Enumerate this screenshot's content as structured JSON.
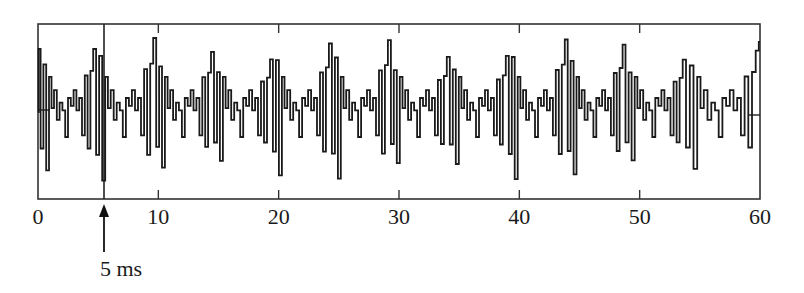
{
  "chart_data": {
    "type": "line",
    "title": "",
    "xlabel": "",
    "ylabel": "",
    "x_unit": "ms",
    "xlim": [
      0,
      60
    ],
    "ylim": [
      -1,
      1
    ],
    "grid": false,
    "x_ticks": [
      0,
      10,
      20,
      30,
      40,
      50,
      60
    ],
    "x_tick_labels": [
      "0",
      "10",
      "20",
      "30",
      "40",
      "50",
      "60"
    ],
    "series": [
      {
        "name": "waveform",
        "description": "Quasi-periodic speech-like waveform with fundamental period of about 5 ms (~200 Hz); each period has a large positive/negative spike pair followed by smaller ripples",
        "period_ms": 4.95,
        "major_peak_times_ms": [
          0.1,
          4.7,
          9.7,
          14.5,
          19.4,
          24.3,
          29.2,
          34.1,
          39.0,
          43.9,
          48.7,
          53.7,
          59.8
        ],
        "period_template": {
          "t": [
            0.0,
            0.25,
            0.5,
            0.75,
            1.0,
            1.2,
            1.45,
            1.7,
            1.95,
            2.2,
            2.45,
            2.7,
            2.95,
            3.2,
            3.45,
            3.7,
            3.95,
            4.2,
            4.45,
            4.7,
            4.95
          ],
          "y": [
            0.95,
            -0.55,
            0.72,
            -0.88,
            0.45,
            0.05,
            0.28,
            -0.1,
            0.12,
            0.02,
            -0.32,
            0.18,
            0.08,
            0.28,
            0.02,
            0.18,
            -0.3,
            0.55,
            -0.55,
            0.62,
            0.95
          ]
        }
      }
    ],
    "annotations": [
      {
        "type": "vertical-line",
        "x": 5.5,
        "label": ""
      },
      {
        "type": "arrow",
        "x": 5.5,
        "label": "5 ms"
      }
    ],
    "zero_line_markers": [
      {
        "x_start": 0,
        "x_end": 1.0,
        "y": 0
      },
      {
        "x_start": 59.2,
        "x_end": 60,
        "y": 0
      }
    ]
  },
  "axis": {
    "tick_labels": [
      "0",
      "10",
      "20",
      "30",
      "40",
      "50",
      "60"
    ]
  },
  "annotation": {
    "arrow_label": "5 ms"
  },
  "colors": {
    "line": "#1a1a1a",
    "frame": "#333333",
    "background": "#ffffff"
  }
}
